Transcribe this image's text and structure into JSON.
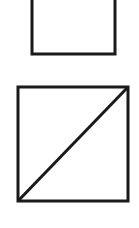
{
  "diagram": {
    "background": "#ffffff",
    "stroke_color": "#1a1a1a",
    "shapes": [
      {
        "id": "top-square",
        "type": "rectangle",
        "x": 32,
        "y": -20,
        "width": 83,
        "height": 74,
        "stroke_width": 3,
        "clipped_top": true
      },
      {
        "id": "bottom-square",
        "type": "rectangle",
        "x": 18,
        "y": 87,
        "width": 110,
        "height": 114,
        "stroke_width": 3,
        "diagonal": "bottom-left-to-top-right"
      }
    ]
  }
}
